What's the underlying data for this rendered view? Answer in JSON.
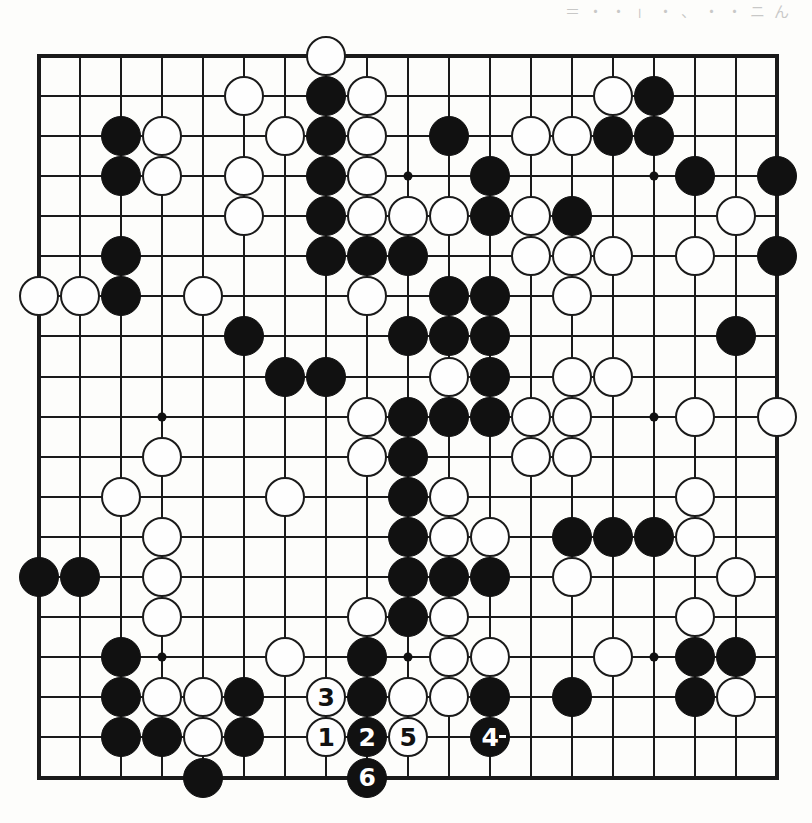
{
  "page": {
    "kind": "go-game-diagram",
    "top_text_fragment": "＝ ・ ・ 」 ・ 、 ・ ・ ニ ん"
  },
  "board": {
    "size": 19,
    "origin_x": 39.3,
    "origin_y": 55.7,
    "step_x": 41.0,
    "step_y": 40.1,
    "line_color": "#1a1a1a",
    "black_color": "#111111",
    "white_color": "#fefefe",
    "star_points": [
      [
        3,
        3
      ],
      [
        9,
        3
      ],
      [
        15,
        3
      ],
      [
        3,
        9
      ],
      [
        9,
        9
      ],
      [
        15,
        9
      ],
      [
        3,
        15
      ],
      [
        9,
        15
      ],
      [
        15,
        15
      ]
    ]
  },
  "stones": {
    "black": [
      [
        7,
        1
      ],
      [
        15,
        1
      ],
      [
        2,
        2
      ],
      [
        7,
        2
      ],
      [
        10,
        2
      ],
      [
        14,
        2
      ],
      [
        15,
        2
      ],
      [
        2,
        3
      ],
      [
        7,
        3
      ],
      [
        11,
        3
      ],
      [
        16,
        3
      ],
      [
        18,
        3
      ],
      [
        7,
        4
      ],
      [
        11,
        4
      ],
      [
        13,
        4
      ],
      [
        2,
        5
      ],
      [
        7,
        5
      ],
      [
        8,
        5
      ],
      [
        9,
        5
      ],
      [
        18,
        5
      ],
      [
        2,
        6
      ],
      [
        10,
        6
      ],
      [
        11,
        6
      ],
      [
        5,
        7
      ],
      [
        9,
        7
      ],
      [
        10,
        7
      ],
      [
        11,
        7
      ],
      [
        17,
        7
      ],
      [
        6,
        8
      ],
      [
        7,
        8
      ],
      [
        11,
        8
      ],
      [
        9,
        9
      ],
      [
        10,
        9
      ],
      [
        11,
        9
      ],
      [
        9,
        10
      ],
      [
        9,
        11
      ],
      [
        9,
        12
      ],
      [
        13,
        12
      ],
      [
        14,
        12
      ],
      [
        15,
        12
      ],
      [
        0,
        13
      ],
      [
        1,
        13
      ],
      [
        9,
        13
      ],
      [
        10,
        13
      ],
      [
        11,
        13
      ],
      [
        9,
        14
      ],
      [
        2,
        15
      ],
      [
        8,
        15
      ],
      [
        16,
        15
      ],
      [
        17,
        15
      ],
      [
        2,
        16
      ],
      [
        5,
        16
      ],
      [
        8,
        16
      ],
      [
        11,
        16
      ],
      [
        13,
        16
      ],
      [
        16,
        16
      ],
      [
        2,
        17
      ],
      [
        3,
        17
      ],
      [
        5,
        17
      ],
      [
        4,
        18
      ]
    ],
    "white": [
      [
        7,
        0
      ],
      [
        5,
        1
      ],
      [
        8,
        1
      ],
      [
        14,
        1
      ],
      [
        3,
        2
      ],
      [
        6,
        2
      ],
      [
        8,
        2
      ],
      [
        12,
        2
      ],
      [
        13,
        2
      ],
      [
        3,
        3
      ],
      [
        5,
        3
      ],
      [
        8,
        3
      ],
      [
        5,
        4
      ],
      [
        8,
        4
      ],
      [
        9,
        4
      ],
      [
        10,
        4
      ],
      [
        12,
        4
      ],
      [
        17,
        4
      ],
      [
        12,
        5
      ],
      [
        13,
        5
      ],
      [
        14,
        5
      ],
      [
        16,
        5
      ],
      [
        0,
        6
      ],
      [
        1,
        6
      ],
      [
        4,
        6
      ],
      [
        8,
        6
      ],
      [
        13,
        6
      ],
      [
        10,
        8
      ],
      [
        13,
        8
      ],
      [
        14,
        8
      ],
      [
        8,
        9
      ],
      [
        12,
        9
      ],
      [
        13,
        9
      ],
      [
        16,
        9
      ],
      [
        18,
        9
      ],
      [
        3,
        10
      ],
      [
        8,
        10
      ],
      [
        12,
        10
      ],
      [
        13,
        10
      ],
      [
        2,
        11
      ],
      [
        6,
        11
      ],
      [
        10,
        11
      ],
      [
        16,
        11
      ],
      [
        3,
        12
      ],
      [
        10,
        12
      ],
      [
        11,
        12
      ],
      [
        16,
        12
      ],
      [
        3,
        13
      ],
      [
        13,
        13
      ],
      [
        17,
        13
      ],
      [
        3,
        14
      ],
      [
        8,
        14
      ],
      [
        10,
        14
      ],
      [
        16,
        14
      ],
      [
        6,
        15
      ],
      [
        10,
        15
      ],
      [
        11,
        15
      ],
      [
        14,
        15
      ],
      [
        3,
        16
      ],
      [
        4,
        16
      ],
      [
        9,
        16
      ],
      [
        10,
        16
      ],
      [
        17,
        16
      ],
      [
        4,
        17
      ]
    ]
  },
  "numbered_moves": [
    {
      "n": "1",
      "color": "w",
      "col": 7,
      "row": 17
    },
    {
      "n": "2",
      "color": "b",
      "col": 8,
      "row": 17
    },
    {
      "n": "3",
      "color": "w",
      "col": 7,
      "row": 16
    },
    {
      "n": "4",
      "color": "b",
      "col": 11,
      "row": 17,
      "mark": true
    },
    {
      "n": "5",
      "color": "w",
      "col": 9,
      "row": 17
    },
    {
      "n": "6",
      "color": "b",
      "col": 8,
      "row": 18
    }
  ]
}
